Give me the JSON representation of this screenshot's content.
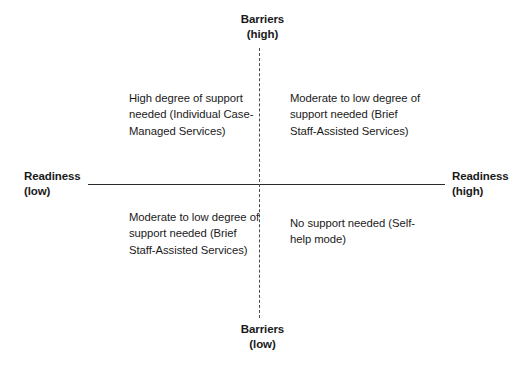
{
  "diagram": {
    "type": "2x2-quadrant-matrix",
    "axes": {
      "vertical": {
        "name": "Barriers",
        "style": "dashed",
        "top_label": "Barriers",
        "top_qualifier": "(high)",
        "bottom_label": "Barriers",
        "bottom_qualifier": "(low)"
      },
      "horizontal": {
        "name": "Readiness",
        "style": "solid",
        "left_label": "Readiness",
        "left_qualifier": "(low)",
        "right_label": "Readiness",
        "right_qualifier": "(high)"
      }
    },
    "quadrants": {
      "top_left": {
        "position": "high barriers / low readiness",
        "text": "High degree of support needed (Individual Case-Managed Services)"
      },
      "top_right": {
        "position": "high barriers / high readiness",
        "text": "Moderate to low degree of support needed (Brief Staff-Assisted Services)"
      },
      "bottom_left": {
        "position": "low barriers / low readiness",
        "text": "Moderate to low degree of support needed (Brief Staff-Assisted Services)"
      },
      "bottom_right": {
        "position": "low barriers / high readiness",
        "text": "No support needed (Self-help mode)"
      }
    },
    "colors": {
      "background": "#ffffff",
      "text": "#1a1a1a",
      "axis_solid": "#2b2b2b",
      "axis_dashed": "#4a4a4a"
    }
  }
}
